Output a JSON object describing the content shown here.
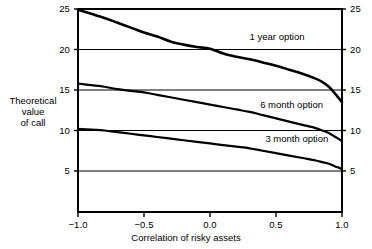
{
  "chart_data": {
    "type": "line",
    "title": "",
    "xlabel": "Correlation of risky assets",
    "ylabel": "Theoretical value of call",
    "ylabel_lines": [
      "Theoretical",
      "value",
      "of call"
    ],
    "xlim": [
      -1.0,
      1.0
    ],
    "ylim": [
      0.0,
      26.0
    ],
    "xticks": [
      -1.0,
      -0.5,
      0.0,
      0.5,
      1.0
    ],
    "xtick_labels": [
      "−1.0",
      "−0.5",
      "0.0",
      "0.5",
      "1.0"
    ],
    "yticks": [
      5,
      10,
      15,
      20,
      25
    ],
    "ytick_labels_left": [
      "5",
      "10",
      "15",
      "20",
      "25"
    ],
    "ytick_labels_right": [
      "5",
      "10",
      "15",
      "20",
      "25"
    ],
    "grid": "horizontal gridlines at y = 5, 10, 15, 20, 25",
    "legend_position": "inline annotations on curves",
    "line_color": "#000000",
    "grid_color": "#000000",
    "axis_color": "#000000",
    "background_color": "#ffffff",
    "series": [
      {
        "name": "1 year option",
        "label": "1 year option",
        "x": [
          -1.0,
          -0.9,
          -0.8,
          -0.7,
          -0.6,
          -0.5,
          -0.4,
          -0.3,
          -0.2,
          -0.1,
          0.0,
          0.1,
          0.2,
          0.3,
          0.4,
          0.5,
          0.6,
          0.7,
          0.8,
          0.85,
          0.9,
          0.93,
          0.96,
          0.98,
          1.0
        ],
        "values": [
          24.9,
          24.4,
          23.9,
          23.3,
          22.7,
          22.1,
          21.6,
          21.0,
          20.6,
          20.3,
          20.1,
          19.5,
          19.1,
          18.8,
          18.4,
          18.0,
          17.5,
          17.0,
          16.4,
          16.0,
          15.4,
          14.9,
          14.3,
          13.9,
          13.5
        ]
      },
      {
        "name": "6 month option",
        "label": "6 month option",
        "x": [
          -1.0,
          -0.9,
          -0.8,
          -0.7,
          -0.6,
          -0.5,
          -0.4,
          -0.3,
          -0.2,
          -0.1,
          0.0,
          0.1,
          0.2,
          0.3,
          0.4,
          0.5,
          0.6,
          0.7,
          0.8,
          0.85,
          0.9,
          0.93,
          0.96,
          0.98,
          1.0
        ],
        "values": [
          15.8,
          15.6,
          15.4,
          15.1,
          14.9,
          14.7,
          14.4,
          14.1,
          13.8,
          13.5,
          13.2,
          12.9,
          12.6,
          12.3,
          11.9,
          11.5,
          11.1,
          10.7,
          10.3,
          10.0,
          9.7,
          9.4,
          9.1,
          8.9,
          8.7
        ]
      },
      {
        "name": "3 month option",
        "label": "3 month option",
        "x": [
          -1.0,
          -0.9,
          -0.8,
          -0.7,
          -0.6,
          -0.5,
          -0.4,
          -0.3,
          -0.2,
          -0.1,
          0.0,
          0.1,
          0.2,
          0.3,
          0.4,
          0.5,
          0.6,
          0.7,
          0.8,
          0.85,
          0.9,
          0.93,
          0.96,
          0.98,
          1.0
        ],
        "values": [
          10.2,
          10.1,
          10.0,
          9.8,
          9.6,
          9.4,
          9.2,
          9.0,
          8.8,
          8.6,
          8.4,
          8.2,
          8.0,
          7.8,
          7.5,
          7.2,
          6.9,
          6.6,
          6.3,
          6.1,
          5.9,
          5.7,
          5.5,
          5.4,
          5.2
        ]
      }
    ],
    "annotations": [
      {
        "text": "1 year option",
        "x": 0.3,
        "y": 21.6
      },
      {
        "text": "6 month option",
        "x": 0.38,
        "y": 13.1
      },
      {
        "text": "3 month option",
        "x": 0.42,
        "y": 8.9
      }
    ]
  }
}
